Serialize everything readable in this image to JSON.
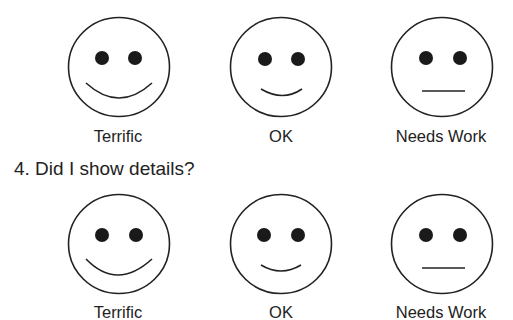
{
  "previous_question_fragment": "",
  "question_4": {
    "text": "4. Did I show details?"
  },
  "rows": [
    {
      "options": [
        {
          "label": "Terrific",
          "expression": "big-smile"
        },
        {
          "label": "OK",
          "expression": "small-smile"
        },
        {
          "label": "Needs Work",
          "expression": "flat-mouth"
        }
      ]
    },
    {
      "options": [
        {
          "label": "Terrific",
          "expression": "big-smile"
        },
        {
          "label": "OK",
          "expression": "small-smile"
        },
        {
          "label": "Needs Work",
          "expression": "flat-mouth"
        }
      ]
    }
  ],
  "colors": {
    "ink": "#222222",
    "background": "#ffffff"
  }
}
